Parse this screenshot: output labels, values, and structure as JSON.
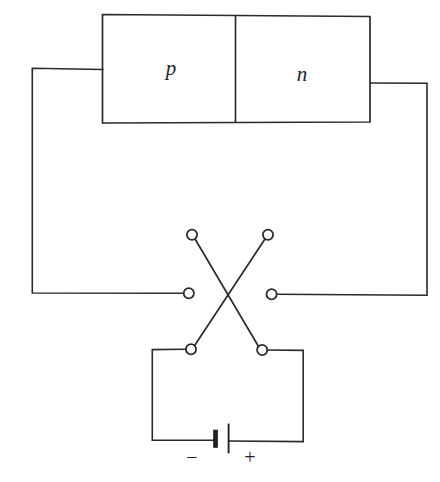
{
  "figure": {
    "stroke_color": "#2b2b2f",
    "background_color": "#ffffff"
  },
  "semiconductor": {
    "p_region_label": "p",
    "n_region_label": "n"
  },
  "battery": {
    "negative_label": "−",
    "positive_label": "+"
  },
  "switch": {
    "terminal_names": [
      "top-left-terminal",
      "top-right-terminal",
      "middle-left-terminal",
      "middle-right-terminal",
      "bottom-left-terminal",
      "bottom-right-terminal"
    ]
  }
}
